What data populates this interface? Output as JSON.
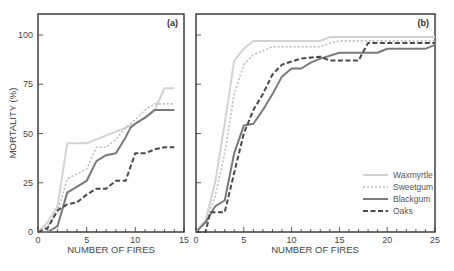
{
  "chart_data": [
    {
      "type": "line",
      "panel_label": "(a)",
      "xlabel": "NUMBER OF FIRES",
      "ylabel": "MORTALITY (%)",
      "xlim": [
        0,
        15
      ],
      "ylim": [
        0,
        110
      ],
      "xticks": [
        0,
        5,
        10,
        15
      ],
      "yticks": [
        0,
        25,
        50,
        75,
        100
      ],
      "grid": false,
      "series": [
        {
          "name": "Waxmyrtle",
          "style": "solid",
          "color": "#d2d2d2",
          "points": [
            [
              0,
              0
            ],
            [
              1,
              5
            ],
            [
              2,
              13
            ],
            [
              3,
              45
            ],
            [
              5,
              45
            ],
            [
              6,
              47
            ],
            [
              8.5,
              52
            ],
            [
              10,
              55
            ],
            [
              11,
              58
            ],
            [
              12,
              62
            ],
            [
              13,
              73
            ],
            [
              14,
              73
            ]
          ]
        },
        {
          "name": "Sweetgum",
          "style": "dotted",
          "color": "#bdbdbd",
          "points": [
            [
              0,
              0
            ],
            [
              1,
              3
            ],
            [
              2,
              10
            ],
            [
              3,
              27
            ],
            [
              5,
              32
            ],
            [
              6,
              43
            ],
            [
              7,
              43
            ],
            [
              8,
              47
            ],
            [
              9,
              53
            ],
            [
              10,
              57
            ],
            [
              11,
              62
            ],
            [
              12,
              65
            ],
            [
              14,
              65
            ]
          ]
        },
        {
          "name": "Blackgum",
          "style": "solid",
          "color": "#7a7a7a",
          "points": [
            [
              0,
              0
            ],
            [
              1,
              0
            ],
            [
              2,
              3
            ],
            [
              3,
              20
            ],
            [
              5,
              26
            ],
            [
              6,
              36
            ],
            [
              7,
              39
            ],
            [
              8,
              40
            ],
            [
              9,
              48
            ],
            [
              9.5,
              53
            ],
            [
              10,
              55
            ],
            [
              11,
              58
            ],
            [
              12,
              62
            ],
            [
              14,
              62
            ]
          ]
        },
        {
          "name": "Oaks",
          "style": "dashed",
          "color": "#4a4a4a",
          "points": [
            [
              0,
              0
            ],
            [
              1,
              2
            ],
            [
              2,
              11
            ],
            [
              3,
              14
            ],
            [
              4,
              15
            ],
            [
              5,
              19
            ],
            [
              6,
              22
            ],
            [
              7,
              22
            ],
            [
              8,
              26
            ],
            [
              9,
              26
            ],
            [
              10,
              40
            ],
            [
              11,
              40
            ],
            [
              12,
              42
            ],
            [
              13,
              43
            ],
            [
              14,
              43
            ]
          ]
        }
      ]
    },
    {
      "type": "line",
      "panel_label": "(b)",
      "xlabel": "NUMBER OF FIRES",
      "ylabel": "",
      "xlim": [
        0,
        25
      ],
      "ylim": [
        0,
        110
      ],
      "xticks": [
        0,
        5,
        10,
        15,
        20,
        25
      ],
      "yticks": [
        0,
        25,
        50,
        75,
        100
      ],
      "grid": false,
      "legend_position": "lower right",
      "series": [
        {
          "name": "Waxmyrtle",
          "style": "solid",
          "color": "#d2d2d2",
          "points": [
            [
              0,
              0
            ],
            [
              1,
              6
            ],
            [
              2,
              25
            ],
            [
              3,
              55
            ],
            [
              4,
              87
            ],
            [
              5,
              93
            ],
            [
              6,
              97
            ],
            [
              13,
              97
            ],
            [
              14,
              99
            ],
            [
              25,
              99
            ]
          ]
        },
        {
          "name": "Sweetgum",
          "style": "dotted",
          "color": "#bdbdbd",
          "points": [
            [
              0,
              0
            ],
            [
              1,
              5
            ],
            [
              2,
              18
            ],
            [
              3,
              40
            ],
            [
              4,
              70
            ],
            [
              5,
              85
            ],
            [
              6,
              90
            ],
            [
              8,
              94
            ],
            [
              13,
              94
            ],
            [
              14,
              96
            ],
            [
              15,
              97
            ],
            [
              25,
              97
            ]
          ]
        },
        {
          "name": "Blackgum",
          "style": "solid",
          "color": "#7a7a7a",
          "points": [
            [
              0,
              0
            ],
            [
              1,
              5
            ],
            [
              2,
              13
            ],
            [
              3,
              16
            ],
            [
              4,
              40
            ],
            [
              5,
              54
            ],
            [
              6,
              55
            ],
            [
              7,
              62
            ],
            [
              8,
              70
            ],
            [
              9,
              79
            ],
            [
              10,
              83
            ],
            [
              11,
              83
            ],
            [
              12,
              86
            ],
            [
              13,
              88
            ],
            [
              15,
              91
            ],
            [
              19,
              91
            ],
            [
              20,
              93
            ],
            [
              24,
              93
            ],
            [
              25,
              95
            ]
          ]
        },
        {
          "name": "Oaks",
          "style": "dashed",
          "color": "#4a4a4a",
          "points": [
            [
              0,
              0
            ],
            [
              1,
              0
            ],
            [
              1.5,
              10
            ],
            [
              3,
              10
            ],
            [
              4,
              30
            ],
            [
              5,
              50
            ],
            [
              6,
              62
            ],
            [
              7,
              70
            ],
            [
              8,
              80
            ],
            [
              9,
              85
            ],
            [
              11,
              88
            ],
            [
              13,
              89
            ],
            [
              14,
              87
            ],
            [
              17,
              87
            ],
            [
              18,
              96
            ],
            [
              25,
              96
            ]
          ]
        }
      ]
    }
  ],
  "legend": {
    "items": [
      "Waxmyrtle",
      "Sweetgum",
      "Blackgum",
      "Oaks"
    ]
  }
}
